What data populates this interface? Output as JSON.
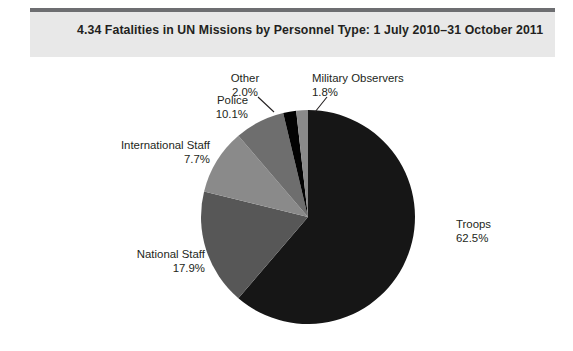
{
  "header": {
    "figure_number": "4.34",
    "title": "4.34  Fatalities in UN Missions by Personnel Type: 1 July 2010–31 October 2011",
    "band_color": "#e8e8e8",
    "rule_color": "#6d6e71"
  },
  "chart_data": {
    "type": "pie",
    "title": "4.34  Fatalities in UN Missions by Personnel Type: 1 July 2010–31 October 2011",
    "xlabel": "",
    "ylabel": "",
    "unit": "%",
    "legend_position": "none",
    "grid": false,
    "categories": [
      "Troops",
      "National Staff",
      "Police",
      "International Staff",
      "Other",
      "Military Observers"
    ],
    "values": [
      62.5,
      17.9,
      10.1,
      7.7,
      2.0,
      1.8
    ],
    "colors": [
      "#161616",
      "#575757",
      "#8a8a8a",
      "#6e6e6e",
      "#030303",
      "#8a8a8a"
    ],
    "slices": [
      {
        "label": "Troops",
        "percent": "62.5%",
        "value": 62.5,
        "color": "#161616",
        "label_align": "left",
        "leader": false
      },
      {
        "label": "National Staff",
        "percent": "17.9%",
        "value": 17.9,
        "color": "#575757",
        "label_align": "right",
        "leader": false
      },
      {
        "label": "Police",
        "percent": "10.1%",
        "value": 10.1,
        "color": "#8a8a8a",
        "label_align": "right",
        "leader": false
      },
      {
        "label": "International Staff",
        "percent": "7.7%",
        "value": 7.7,
        "color": "#6e6e6e",
        "label_align": "right",
        "leader": false
      },
      {
        "label": "Other",
        "percent": "2.0%",
        "value": 2.0,
        "color": "#030303",
        "label_align": "center",
        "leader": true
      },
      {
        "label": "Military Observers",
        "percent": "1.8%",
        "value": 1.8,
        "color": "#8a8a8a",
        "label_align": "left",
        "leader": true
      }
    ]
  }
}
